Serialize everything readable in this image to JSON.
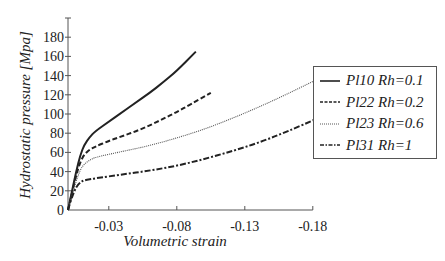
{
  "chart_data": {
    "type": "line",
    "title": "",
    "xlabel": "Volumetric strain",
    "ylabel": "Hydrostatic pressure [Mpa]",
    "xlim": [
      0,
      -0.18
    ],
    "ylim": [
      0,
      190
    ],
    "xticks": [
      -0.03,
      -0.08,
      -0.13,
      -0.18
    ],
    "xtick_labels": [
      "-0.03",
      "-0.08",
      "-0.13",
      "-0.18"
    ],
    "yticks": [
      0,
      20,
      40,
      60,
      80,
      100,
      120,
      140,
      160,
      180
    ],
    "ytick_labels": [
      "0",
      "20",
      "40",
      "60",
      "80",
      "100",
      "120",
      "140",
      "160",
      "180"
    ],
    "grid": false,
    "legend_position": "right",
    "series": [
      {
        "name": "Pl10 Rh=0.1",
        "style": "solid",
        "x": [
          0,
          -0.003,
          -0.006,
          -0.009,
          -0.012,
          -0.016,
          -0.02,
          -0.03,
          -0.04,
          -0.05,
          -0.06,
          -0.07,
          -0.08,
          -0.094
        ],
        "y": [
          0,
          20,
          40,
          57,
          68,
          76,
          82,
          92,
          102,
          112,
          122,
          133,
          145,
          165
        ]
      },
      {
        "name": "Pl22 Rh=0.2",
        "style": "dashed",
        "x": [
          0,
          -0.003,
          -0.006,
          -0.009,
          -0.012,
          -0.016,
          -0.02,
          -0.03,
          -0.04,
          -0.05,
          -0.06,
          -0.07,
          -0.08,
          -0.09,
          -0.105
        ],
        "y": [
          0,
          18,
          36,
          50,
          58,
          63,
          66,
          72,
          77,
          82,
          88,
          95,
          102,
          110,
          122
        ]
      },
      {
        "name": "Pl23 Rh=0.6",
        "style": "dotted",
        "x": [
          0,
          -0.003,
          -0.006,
          -0.009,
          -0.012,
          -0.016,
          -0.02,
          -0.04,
          -0.06,
          -0.08,
          -0.1,
          -0.12,
          -0.14,
          -0.16,
          -0.186
        ],
        "y": [
          0,
          16,
          30,
          42,
          48,
          52,
          55,
          61,
          67,
          75,
          84,
          95,
          107,
          120,
          138
        ]
      },
      {
        "name": "Pl31 Rh=1",
        "style": "dashdot",
        "x": [
          0,
          -0.003,
          -0.006,
          -0.009,
          -0.012,
          -0.016,
          -0.02,
          -0.04,
          -0.06,
          -0.08,
          -0.1,
          -0.12,
          -0.14,
          -0.16,
          -0.186
        ],
        "y": [
          0,
          14,
          24,
          29,
          31,
          32,
          33,
          37,
          41,
          46,
          53,
          61,
          70,
          81,
          97
        ]
      }
    ]
  },
  "legend": {
    "items": [
      {
        "label": "Pl10 Rh=0.1",
        "style": "solid"
      },
      {
        "label": "Pl22 Rh=0.2",
        "style": "dashed"
      },
      {
        "label": "Pl23 Rh=0.6",
        "style": "dotted"
      },
      {
        "label": "Pl31 Rh=1",
        "style": "dashdot"
      }
    ]
  },
  "colors": {
    "line": "#222222",
    "axis": "#555555"
  }
}
